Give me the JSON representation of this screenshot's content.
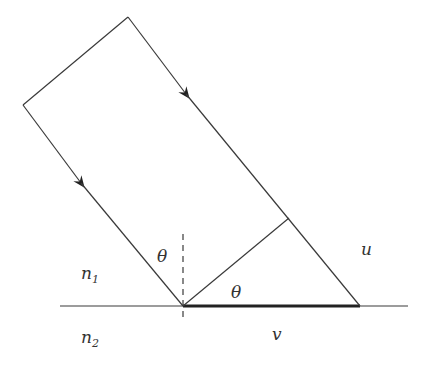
{
  "diagram": {
    "type": "wavefront refraction geometry",
    "labels": {
      "theta_incidence": "θ",
      "theta_wedge": "θ",
      "medium_upper": "n",
      "medium_upper_sub": "1",
      "medium_lower": "n",
      "medium_lower_sub": "2",
      "segment_u": "u",
      "segment_v": "v"
    },
    "elements": [
      "incident beam (two parallel rays with arrows)",
      "wavefront perpendicular to rays",
      "interface line",
      "dashed normal",
      "highlighted segment v on interface"
    ]
  }
}
